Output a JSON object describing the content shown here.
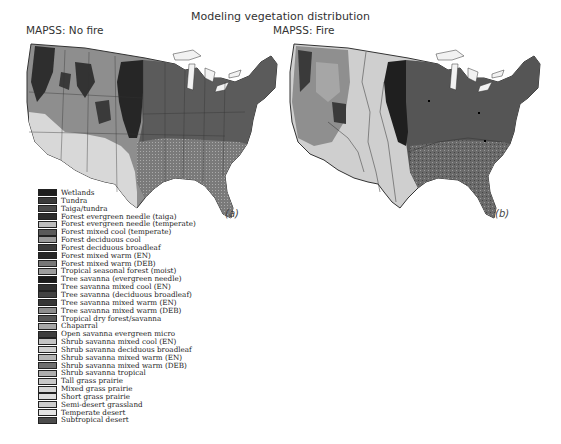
{
  "figure": {
    "title": "Modeling vegetation distribution",
    "panels": [
      {
        "label": "MAPSS: No fire",
        "tag": "(a)"
      },
      {
        "label": "MAPSS: Fire",
        "tag": "(b)"
      }
    ]
  },
  "legend": {
    "items": [
      {
        "label": "Wetlands",
        "color": "#1e1e1e"
      },
      {
        "label": "Tundra",
        "color": "#3a3a3a"
      },
      {
        "label": "Taiga/tundra",
        "color": "#4a4a4a"
      },
      {
        "label": "Forest evergreen needle (taiga)",
        "color": "#2c2c2c"
      },
      {
        "label": "Forest evergreen needle (temperate)",
        "color": "#bdbdbd"
      },
      {
        "label": "Forest mixed cool (temperate)",
        "color": "#5a5a5a"
      },
      {
        "label": "Forest deciduous cool",
        "color": "#9a9a9a"
      },
      {
        "label": "Forest deciduous broadleaf",
        "color": "#3c3c3c"
      },
      {
        "label": "Forest mixed warm (EN)",
        "color": "#262626"
      },
      {
        "label": "Forest mixed warm (DEB)",
        "color": "#777777"
      },
      {
        "label": "Tropical seasonal forest (moist)",
        "color": "#9c9c9c"
      },
      {
        "label": "Tree savanna (evergreen needle)",
        "color": "#1a1a1a"
      },
      {
        "label": "Tree savanna mixed cool (EN)",
        "color": "#303030"
      },
      {
        "label": "Tree savanna (deciduous broadleaf)",
        "color": "#424242"
      },
      {
        "label": "Tree savanna mixed warm (EN)",
        "color": "#363636"
      },
      {
        "label": "Tree savanna mixed warm (DEB)",
        "color": "#8d8d8d"
      },
      {
        "label": "Tropical dry forest/savanna",
        "color": "#555555"
      },
      {
        "label": "Chaparral",
        "color": "#a8a8a8"
      },
      {
        "label": "Open savanna evergreen micro",
        "color": "#3e3e3e"
      },
      {
        "label": "Shrub savanna mixed cool (EN)",
        "color": "#c4c4c4"
      },
      {
        "label": "Shrub savanna deciduous broadleaf",
        "color": "#cfcfcf"
      },
      {
        "label": "Shrub savanna mixed warm (EN)",
        "color": "#b4b4b4"
      },
      {
        "label": "Shrub savanna mixed warm (DEB)",
        "color": "#6e6e6e"
      },
      {
        "label": "Shrub savanna tropical",
        "color": "#adadad"
      },
      {
        "label": "Tall grass prairie",
        "color": "#c8c8c8"
      },
      {
        "label": "Mixed grass prairie",
        "color": "#d6d6d6"
      },
      {
        "label": "Short grass prairie",
        "color": "#dedede"
      },
      {
        "label": "Semi-desert grassland",
        "color": "#cccccc"
      },
      {
        "label": "Temperate desert",
        "color": "#e4e4e4"
      },
      {
        "label": "Subtropical desert",
        "color": "#4c4c4c"
      }
    ]
  },
  "colors": {
    "map_outline": "#333333",
    "east_forest": "#5b5b5b",
    "west_mixed": "#8e8e8e",
    "southwest_desert": "#d8d8d8",
    "dark_band": "#262626",
    "lakes": "#f2f2f2",
    "fire_grass_band": "#d2d2d2"
  }
}
